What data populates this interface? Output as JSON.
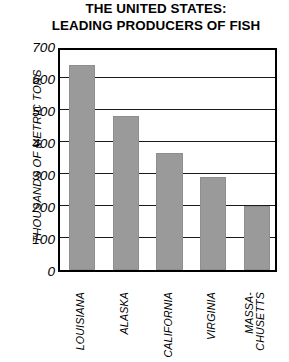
{
  "title": {
    "line1": "THE UNITED STATES:",
    "line2": "LEADING PRODUCERS OF FISH"
  },
  "axis": {
    "ylabel": "THOUSANDS OF METRIC TONS",
    "xlabel": ""
  },
  "colors": {
    "bar_fill": "#9a9a9a",
    "bar_edge": "#8e8e8e",
    "axis": "#000000",
    "grid": "#1a1a1a",
    "background": "#ffffff",
    "text": "#000000"
  },
  "yticks": [
    {
      "value": 0,
      "text": "0"
    },
    {
      "value": 100,
      "text": "100"
    },
    {
      "value": 200,
      "text": "200"
    },
    {
      "value": 300,
      "text": "300"
    },
    {
      "value": 400,
      "text": "400"
    },
    {
      "value": 500,
      "text": "500"
    },
    {
      "value": 600,
      "text": "600"
    },
    {
      "value": 700,
      "text": "700"
    }
  ],
  "xticks": [
    {
      "lines": [
        "LOUISIANA"
      ]
    },
    {
      "lines": [
        "ALASKA"
      ]
    },
    {
      "lines": [
        "CALIFORNIA"
      ]
    },
    {
      "lines": [
        "VIRGINIA"
      ]
    },
    {
      "lines": [
        "MASSA-",
        "CHUSETTS"
      ]
    }
  ],
  "chart_data": {
    "type": "bar",
    "title": "THE UNITED STATES: LEADING PRODUCERS OF FISH",
    "xlabel": "",
    "ylabel": "THOUSANDS OF METRIC TONS",
    "categories": [
      "LOUISIANA",
      "ALASKA",
      "CALIFORNIA",
      "VIRGINIA",
      "MASSACHUSETTS"
    ],
    "values": [
      640,
      480,
      365,
      290,
      200
    ],
    "ylim": [
      0,
      700
    ],
    "ytick_values": [
      0,
      100,
      200,
      300,
      400,
      500,
      600,
      700
    ],
    "grid": true,
    "grid_axis": "y",
    "legend": false,
    "orientation": "vertical",
    "bar_color": "#9a9a9a"
  }
}
